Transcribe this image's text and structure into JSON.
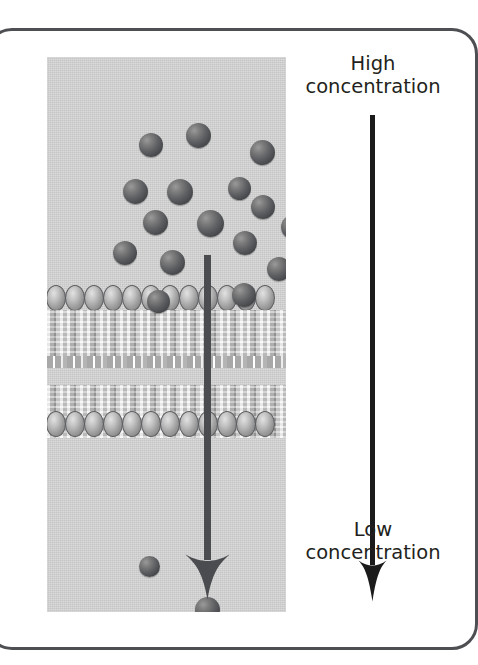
{
  "figure": {
    "kind": "diffusion-across-membrane-diagram",
    "frame_color": "#4d4f53",
    "panel_background": "#d3d3d3",
    "page_background": "#ffffff"
  },
  "gradient_axis": {
    "top_label_line1": "High",
    "top_label_line2": "concentration",
    "bottom_label_line1": "Low",
    "bottom_label_line2": "concentration",
    "arrow_color": "#1b1b1b",
    "direction": "downward"
  },
  "diffusion_arrow": {
    "color": "#4a4c4f",
    "direction": "downward",
    "description": "net movement of solute from high to low concentration through the membrane"
  },
  "membrane": {
    "label": "phospholipid bilayer",
    "head_count_per_row": 12,
    "head_color": "#9d9d9d",
    "head_outline": "#5c5e61",
    "tail_color": "#b9b9b9"
  },
  "molecules": {
    "color": "#5f6063",
    "count_above_membrane": 16,
    "count_below_membrane": 2,
    "above": [
      {
        "x": 104,
        "y": 88,
        "d": 24
      },
      {
        "x": 151,
        "y": 78,
        "d": 25
      },
      {
        "x": 215,
        "y": 95,
        "d": 25
      },
      {
        "x": 88,
        "y": 134,
        "d": 25
      },
      {
        "x": 133,
        "y": 135,
        "d": 26
      },
      {
        "x": 192,
        "y": 131,
        "d": 23
      },
      {
        "x": 216,
        "y": 150,
        "d": 24
      },
      {
        "x": 108,
        "y": 165,
        "d": 25
      },
      {
        "x": 163,
        "y": 166,
        "d": 27
      },
      {
        "x": 246,
        "y": 170,
        "d": 24
      },
      {
        "x": 198,
        "y": 186,
        "d": 24
      },
      {
        "x": 78,
        "y": 196,
        "d": 24
      },
      {
        "x": 125,
        "y": 205,
        "d": 25
      },
      {
        "x": 232,
        "y": 212,
        "d": 24
      },
      {
        "x": 111,
        "y": 244,
        "d": 23
      },
      {
        "x": 197,
        "y": 238,
        "d": 24
      }
    ],
    "below": [
      {
        "x": 102,
        "y": 509,
        "d": 21
      },
      {
        "x": 160,
        "y": 552,
        "d": 25
      }
    ]
  }
}
